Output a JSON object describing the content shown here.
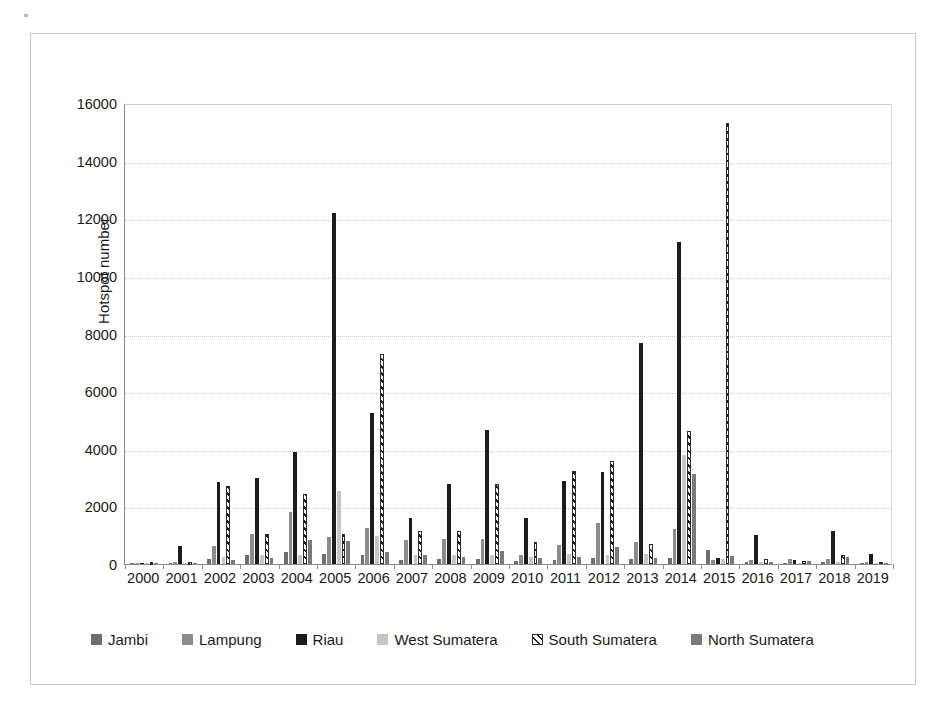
{
  "chart_data": {
    "type": "bar",
    "title": "",
    "subtitle": "",
    "xlabel": "",
    "ylabel": "Hotspot number",
    "ylim": [
      0,
      16000
    ],
    "ytick_values": [
      0,
      2000,
      4000,
      6000,
      8000,
      10000,
      12000,
      14000,
      16000
    ],
    "ytick_labels": [
      "0",
      "2000",
      "4000",
      "6000",
      "8000",
      "10000",
      "12000",
      "14000",
      "16000"
    ],
    "grid": true,
    "legend_position": "bottom",
    "categories": [
      "2000",
      "2001",
      "2002",
      "2003",
      "2004",
      "2005",
      "2006",
      "2007",
      "2008",
      "2009",
      "2010",
      "2011",
      "2012",
      "2013",
      "2014",
      "2015",
      "2016",
      "2017",
      "2018",
      "2019"
    ],
    "series": [
      {
        "name": "Jambi",
        "color": "#6e6e6e",
        "pattern": "solid",
        "values": [
          20,
          40,
          170,
          300,
          420,
          340,
          330,
          140,
          170,
          180,
          120,
          150,
          220,
          160,
          200,
          470,
          60,
          40,
          70,
          30
        ]
      },
      {
        "name": "Lampung",
        "color": "#8c8c8c",
        "pattern": "solid",
        "values": [
          15,
          60,
          640,
          1040,
          1800,
          950,
          1260,
          830,
          880,
          880,
          330,
          660,
          1430,
          760,
          1200,
          140,
          130,
          160,
          190,
          60
        ]
      },
      {
        "name": "Riau",
        "color": "#1c1c1c",
        "pattern": "solid",
        "values": [
          30,
          620,
          2830,
          2980,
          3880,
          12200,
          5240,
          1600,
          2780,
          4650,
          1580,
          2890,
          3210,
          7680,
          11180,
          210,
          1010,
          130,
          1130,
          340
        ]
      },
      {
        "name": "West Sumatera",
        "color": "#c6c6c6",
        "pattern": "solid",
        "values": [
          10,
          30,
          240,
          300,
          330,
          2540,
          960,
          300,
          330,
          300,
          240,
          340,
          330,
          340,
          3780,
          160,
          60,
          50,
          60,
          40
        ]
      },
      {
        "name": "South Sumatera",
        "color": "#1c1c1c",
        "pattern": "diagonal-hatch",
        "values": [
          25,
          40,
          2720,
          1030,
          2420,
          1030,
          7290,
          1130,
          1160,
          2760,
          760,
          3230,
          3560,
          700,
          4610,
          15320,
          170,
          100,
          330,
          60
        ]
      },
      {
        "name": "North Sumatera",
        "color": "#7a7a7a",
        "pattern": "solid",
        "values": [
          20,
          35,
          140,
          200,
          850,
          800,
          400,
          300,
          250,
          450,
          200,
          250,
          600,
          220,
          3110,
          280,
          60,
          90,
          230,
          30
        ]
      }
    ]
  },
  "axis": {
    "y_title": "Hotspot number"
  }
}
